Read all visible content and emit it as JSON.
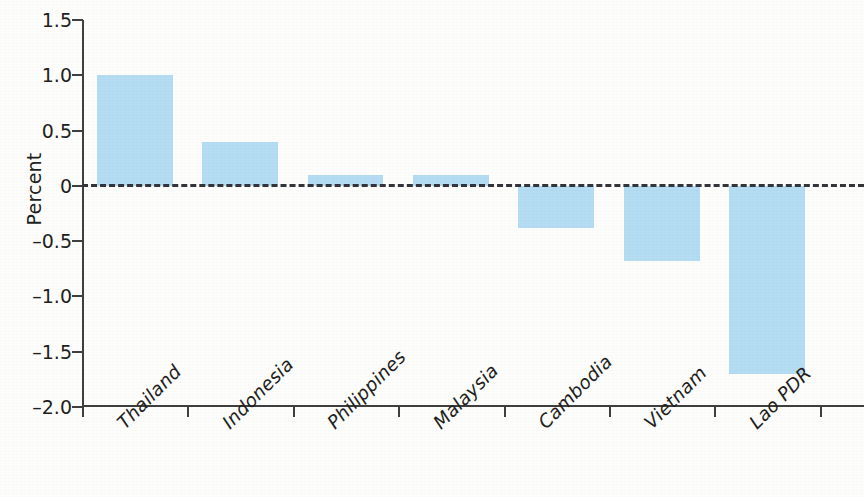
{
  "chart_data": {
    "type": "bar",
    "title": "",
    "subtitle": "",
    "xlabel": "",
    "ylabel": "Percent",
    "categories": [
      "Thailand",
      "Indonesia",
      "Philippines",
      "Malaysia",
      "Cambodia",
      "Vietnam",
      "Lao PDR"
    ],
    "values": [
      1.0,
      0.4,
      0.1,
      0.1,
      -0.38,
      -0.68,
      -1.7
    ],
    "ylim": [
      -2.0,
      1.5
    ],
    "yticks": [
      1.5,
      1.0,
      0.5,
      0,
      -0.5,
      -1.0,
      -1.5,
      -2.0
    ],
    "ytick_labels": [
      "1.5",
      "1.0",
      "0.5",
      "0",
      "–0.5",
      "–1.0",
      "–1.5",
      "–2.0"
    ],
    "grid": false,
    "legend": null,
    "legend_position": "none",
    "zero_line": true,
    "zero_line_style": "dashed",
    "bar_color": "#b4dcf2",
    "axis_color": "#3f3f3f",
    "text_color": "#231f20",
    "xtick_label_rotation": -45,
    "xtick_label_style": "italic"
  },
  "axis": {
    "y_title": "Percent"
  }
}
